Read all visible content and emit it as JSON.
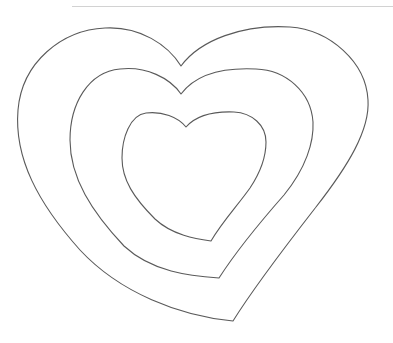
{
  "document": {
    "title": "Nested Hearts Outline",
    "background_color": "#ffffff",
    "width": 393,
    "height": 343,
    "description": "Line-art drawing of three concentric heart outlines with a thin horizontal rule across the top of the page."
  },
  "top_rule": {
    "name": "horizontal-rule",
    "color": "#d2d2d2",
    "stroke_width": 1.2,
    "x1": 72,
    "y1": 6.5,
    "x2": 393,
    "y2": 6.5
  },
  "figure": {
    "name": "nested-hearts-figure",
    "stroke_color": "#5a5a5a",
    "fill": "none",
    "shape_count": 3,
    "shapes": [
      {
        "id": "heart-outer",
        "label": "Outer heart outline",
        "stroke_width": 1.1,
        "notch_point": [
          181,
          66
        ],
        "bottom_tip": [
          233,
          321
        ],
        "left_extent": [
          18,
          146
        ],
        "right_extent": [
          368,
          144
        ],
        "top_extent_y": 28,
        "path": "M 181 66 C 168 45 140 26 105 28 C 62 30 22 62 18 110 C 14 158 38 203 80 250 C 120 293 180 316 233 321 C 256 284 288 243 316 207 C 348 166 370 130 368 100 C 366 62 330 30 290 27 C 243 24 200 40 181 66 Z"
      },
      {
        "id": "heart-middle",
        "label": "Middle heart outline",
        "stroke_width": 1.1,
        "notch_point": [
          181,
          94
        ],
        "bottom_tip": [
          219,
          278
        ],
        "left_extent": [
          70,
          150
        ],
        "right_extent": [
          313,
          148
        ],
        "top_extent_y": 69,
        "path": "M 181 94 C 170 78 146 66 120 69 C 88 72 70 104 70 140 C 70 178 92 212 124 246 C 152 272 190 276 219 278 C 237 250 262 220 284 195 C 306 168 314 142 313 122 C 311 92 286 70 256 69 C 216 67 193 78 181 94 Z"
      },
      {
        "id": "heart-inner",
        "label": "Inner heart outline",
        "stroke_width": 1.1,
        "notch_point": [
          186,
          127
        ],
        "bottom_tip": [
          211,
          241
        ],
        "left_extent": [
          122,
          161
        ],
        "right_extent": [
          266,
          157
        ],
        "top_extent_y": 112,
        "path": "M 186 127 C 178 117 162 111 146 113 C 130 115 122 138 122 158 C 122 180 134 198 155 219 C 172 235 196 239 211 241 C 222 222 238 205 250 188 C 262 170 266 154 266 142 C 266 125 252 113 234 112 C 208 111 194 118 186 127 Z"
      }
    ]
  }
}
